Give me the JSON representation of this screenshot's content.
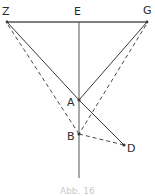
{
  "figure": {
    "caption": "Abb. 16",
    "width": 155,
    "height": 196,
    "background_color": "#ffffff",
    "line_color": "#3a3a3a",
    "label_color": "#2b2b2b",
    "caption_color": "#c9c9c9"
  },
  "points": {
    "Z": {
      "label": "Z",
      "x": 7,
      "y": 22,
      "label_x": 2,
      "label_y": 15
    },
    "E": {
      "label": "E",
      "x": 79,
      "y": 22,
      "label_x": 74,
      "label_y": 15
    },
    "G": {
      "label": "G",
      "x": 147,
      "y": 22,
      "label_x": 143,
      "label_y": 14
    },
    "A": {
      "label": "A",
      "x": 79,
      "y": 100,
      "label_x": 67,
      "label_y": 106
    },
    "B": {
      "label": "B",
      "x": 79,
      "y": 134,
      "label_x": 67,
      "label_y": 140
    },
    "D": {
      "label": "D",
      "x": 124,
      "y": 145,
      "label_x": 127,
      "label_y": 152
    }
  },
  "segments": {
    "baseline": {
      "name": "Z-G",
      "style": "solid",
      "x1": 7,
      "y1": 22,
      "x2": 147,
      "y2": 22
    },
    "axis": {
      "name": "E-vertical",
      "style": "solid",
      "x1": 79,
      "y1": 22,
      "x2": 79,
      "y2": 178
    },
    "solid": [
      {
        "name": "Z-A",
        "x1": 7,
        "y1": 22,
        "x2": 79,
        "y2": 100
      },
      {
        "name": "G-A",
        "x1": 147,
        "y1": 22,
        "x2": 79,
        "y2": 100
      },
      {
        "name": "A-D",
        "x1": 79,
        "y1": 100,
        "x2": 124,
        "y2": 145
      }
    ],
    "dashed": [
      {
        "name": "Z-B",
        "x1": 8,
        "y1": 25,
        "x2": 79,
        "y2": 134
      },
      {
        "name": "G-B",
        "x1": 146,
        "y1": 25,
        "x2": 79,
        "y2": 134
      },
      {
        "name": "B-D",
        "x1": 79,
        "y1": 134,
        "x2": 124,
        "y2": 145
      }
    ]
  }
}
